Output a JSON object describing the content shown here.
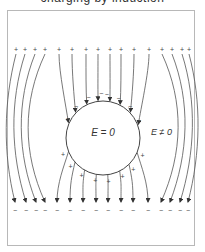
{
  "caption": "charging by induction",
  "diagram": {
    "inside_label": "E = 0",
    "outside_label": "E ≠ 0",
    "top_plate_charge": "+",
    "bottom_plate_charge": "−",
    "sphere": {
      "cx": 103,
      "cy": 138,
      "r": 37
    },
    "top_charges_x": [
      16,
      25,
      35,
      45,
      59,
      72,
      86,
      98,
      110,
      121,
      134,
      149,
      162,
      172,
      182,
      189
    ],
    "bottom_charges_x": [
      15,
      26,
      36,
      45,
      57,
      70,
      83,
      96,
      108,
      121,
      133,
      148,
      161,
      170,
      180,
      188
    ],
    "line_color": "#444444",
    "frame_color": "#b8b8b8"
  }
}
